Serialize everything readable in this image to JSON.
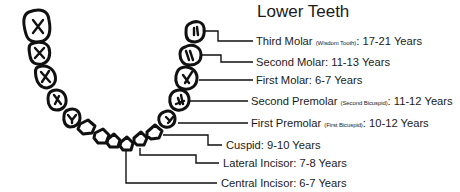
{
  "title": "Lower Teeth",
  "teeth": [
    {
      "name": "Third Molar",
      "note": "(Wisdom Tooth)",
      "age": "17-21 Years"
    },
    {
      "name": "Second Molar",
      "note": "",
      "age": "11-13 Years"
    },
    {
      "name": "First Molar",
      "note": "",
      "age": "6-7 Years"
    },
    {
      "name": "Second Premolar",
      "note": "(Second Bicuspid)",
      "age": "11-12 Years"
    },
    {
      "name": "First Premolar",
      "note": "(First Bicuspid)",
      "age": "10-12 Years"
    },
    {
      "name": "Cuspid",
      "note": "",
      "age": "9-10 Years"
    },
    {
      "name": "Lateral Incisor",
      "note": "",
      "age": "7-8 Years"
    },
    {
      "name": "Central Incisor",
      "note": "",
      "age": "6-7 Years"
    }
  ],
  "labels": {
    "0": {
      "name": "Third Molar",
      "note": "(Wisdom Tooth)",
      "sep": ":",
      "age": "17-21 Years"
    },
    "1": {
      "name": "Second Molar",
      "sep": ":",
      "age": "11-13 Years"
    },
    "2": {
      "name": "First Molar",
      "sep": ":",
      "age": "6-7 Years"
    },
    "3": {
      "name": "Second Premolar",
      "note": "(Second Bicuspid)",
      "sep": ":",
      "age": "11-12 Years"
    },
    "4": {
      "name": "First Premolar",
      "note": "(First Bicuspid)",
      "sep": ":",
      "age": "10-12 Years"
    },
    "5": {
      "name": "Cuspid",
      "sep": ":",
      "age": "9-10 Years"
    },
    "6": {
      "name": "Lateral Incisor",
      "sep": ":",
      "age": "7-8 Years"
    },
    "7": {
      "name": "Central Incisor",
      "sep": ":",
      "age": "6-7 Years"
    }
  },
  "colors": {
    "ink": "#111111",
    "text": "#1a1a1a",
    "background": "#ffffff"
  }
}
